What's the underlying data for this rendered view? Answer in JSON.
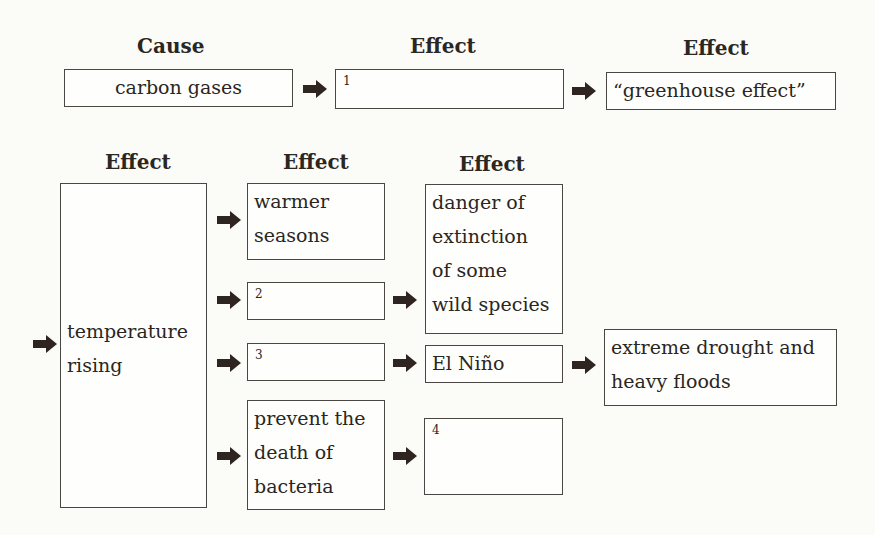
{
  "headers": {
    "cause": "Cause",
    "effect_row1_a": "Effect",
    "effect_row1_b": "Effect",
    "effect_row2_a": "Effect",
    "effect_row2_b": "Effect",
    "effect_row2_c": "Effect"
  },
  "boxes": {
    "carbon_gases": "carbon gases",
    "blank_1": "1",
    "greenhouse_effect": "“greenhouse effect”",
    "temperature_rising_1": "temperature",
    "temperature_rising_2": "rising",
    "warmer_seasons_1": "warmer",
    "warmer_seasons_2": "seasons",
    "blank_2": "2",
    "blank_3": "3",
    "prevent_1": "prevent the",
    "prevent_2": "death of",
    "prevent_3": "bacteria",
    "danger_1": "danger of",
    "danger_2": "extinction",
    "danger_3": "of some",
    "danger_4": "wild species",
    "el_nino": "El Niño",
    "blank_4": "4",
    "drought_1": "extreme drought and",
    "drought_2": "heavy floods"
  },
  "colors": {
    "arrow": "#2e2420",
    "border": "#4a4642",
    "background": "#fbfbf7"
  }
}
